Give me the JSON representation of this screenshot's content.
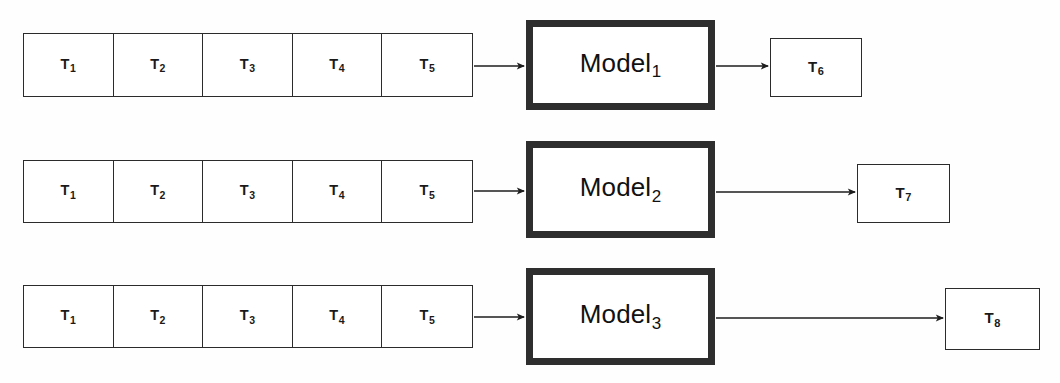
{
  "diagram": {
    "background_color": "#ffffff",
    "line_color": "#2b2b2b",
    "model_border_color": "#2e2e2e",
    "text_color": "#1a1a1a"
  },
  "rows": [
    {
      "id": "row-1",
      "input_tokens": [
        {
          "base": "T",
          "sub": "1"
        },
        {
          "base": "T",
          "sub": "2"
        },
        {
          "base": "T",
          "sub": "3"
        },
        {
          "base": "T",
          "sub": "4"
        },
        {
          "base": "T",
          "sub": "5"
        }
      ],
      "model": {
        "base": "Model",
        "sub": "1"
      },
      "output_token": {
        "base": "T",
        "sub": "6"
      }
    },
    {
      "id": "row-2",
      "input_tokens": [
        {
          "base": "T",
          "sub": "1"
        },
        {
          "base": "T",
          "sub": "2"
        },
        {
          "base": "T",
          "sub": "3"
        },
        {
          "base": "T",
          "sub": "4"
        },
        {
          "base": "T",
          "sub": "5"
        }
      ],
      "model": {
        "base": "Model",
        "sub": "2"
      },
      "output_token": {
        "base": "T",
        "sub": "7"
      }
    },
    {
      "id": "row-3",
      "input_tokens": [
        {
          "base": "T",
          "sub": "1"
        },
        {
          "base": "T",
          "sub": "2"
        },
        {
          "base": "T",
          "sub": "3"
        },
        {
          "base": "T",
          "sub": "4"
        },
        {
          "base": "T",
          "sub": "5"
        }
      ],
      "model": {
        "base": "Model",
        "sub": "3"
      },
      "output_token": {
        "base": "T",
        "sub": "8"
      }
    }
  ]
}
